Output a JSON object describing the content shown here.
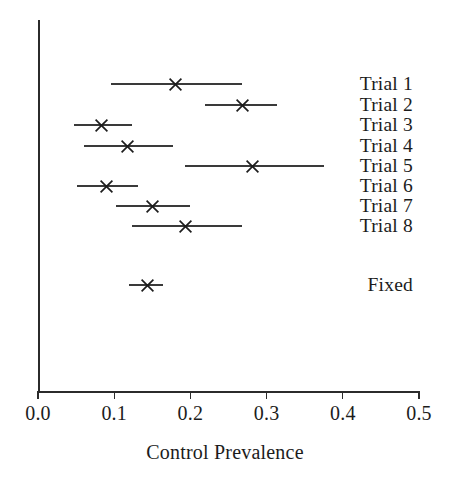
{
  "chart_data": {
    "type": "scatter",
    "title": "",
    "xlabel": "Control Prevalence",
    "ylabel": "",
    "xlim": [
      0.0,
      0.5
    ],
    "xticks": [
      0.0,
      0.1,
      0.2,
      0.3,
      0.4,
      0.5
    ],
    "xtick_labels": [
      "0.0",
      "0.1",
      "0.2",
      "0.3",
      "0.4",
      "0.5"
    ],
    "grid": false,
    "legend": null,
    "marker": "x",
    "categories": [
      "Trial 1",
      "Trial 2",
      "Trial 3",
      "Trial 4",
      "Trial 5",
      "Trial 6",
      "Trial 7",
      "Trial 8",
      "Fixed"
    ],
    "values": [
      0.181,
      0.268,
      0.083,
      0.117,
      0.281,
      0.09,
      0.15,
      0.193,
      0.144
    ],
    "ci_low": [
      0.096,
      0.219,
      0.047,
      0.061,
      0.193,
      0.051,
      0.103,
      0.123,
      0.12
    ],
    "ci_high": [
      0.268,
      0.314,
      0.124,
      0.177,
      0.375,
      0.131,
      0.199,
      0.268,
      0.164
    ],
    "rows": [
      {
        "label": "Trial 1",
        "estimate": 0.181,
        "low": 0.096,
        "high": 0.268,
        "y": 84
      },
      {
        "label": "Trial 2",
        "estimate": 0.268,
        "low": 0.219,
        "high": 0.314,
        "y": 105
      },
      {
        "label": "Trial 3",
        "estimate": 0.083,
        "low": 0.047,
        "high": 0.124,
        "y": 125
      },
      {
        "label": "Trial 4",
        "estimate": 0.117,
        "low": 0.061,
        "high": 0.177,
        "y": 146
      },
      {
        "label": "Trial 5",
        "estimate": 0.281,
        "low": 0.193,
        "high": 0.375,
        "y": 166
      },
      {
        "label": "Trial 6",
        "estimate": 0.09,
        "low": 0.051,
        "high": 0.131,
        "y": 186
      },
      {
        "label": "Trial 7",
        "estimate": 0.15,
        "low": 0.103,
        "high": 0.199,
        "y": 206
      },
      {
        "label": "Trial 8",
        "estimate": 0.193,
        "low": 0.123,
        "high": 0.268,
        "y": 226
      },
      {
        "label": "Fixed",
        "estimate": 0.144,
        "low": 0.12,
        "high": 0.164,
        "y": 285
      }
    ]
  },
  "axis": {
    "origin_px": 38,
    "end_px": 419,
    "baseline_px": 391,
    "top_px": 20,
    "color": "#2b2b2b"
  },
  "style": {
    "line_color": "#3a3a3a",
    "marker_color": "#1c1c1c",
    "text_color": "#1c1c1c",
    "background": "#ffffff"
  }
}
